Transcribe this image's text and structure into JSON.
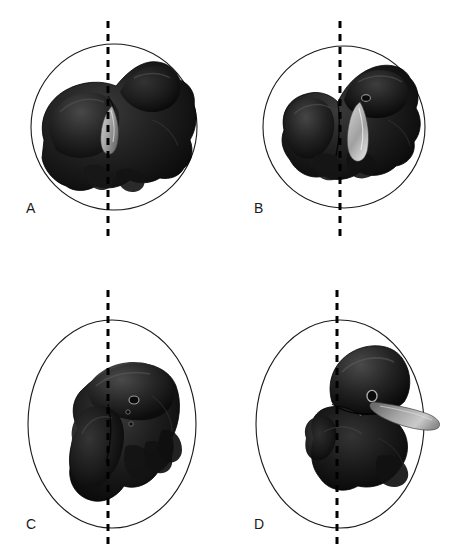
{
  "figure": {
    "background_color": "#ffffff",
    "outline_color": "#1a1a1a",
    "midline_color": "#000000",
    "specimen_dark": "#141414",
    "specimen_mid": "#2b2b2b",
    "specimen_highlight": "#555555",
    "accessory_gray": "#9a9a9a",
    "accessory_gray_light": "#cfcfcf",
    "panel_count": 4,
    "layout": "2x2 grid",
    "width": 456,
    "height": 557
  },
  "panels": [
    {
      "id": "A",
      "label": "A",
      "label_x": 26,
      "label_y": 201,
      "boundary_shape": "circle",
      "boundary_cx": 114,
      "boundary_cy": 127,
      "boundary_rx": 83,
      "boundary_ry": 83,
      "midline_x": 108,
      "midline_y1": 21,
      "midline_y2": 237,
      "specimen_name": "liver-specimen-a",
      "orientation": "transverse-superior-view",
      "accessory_structure": "gallbladder-teardrop",
      "accessory_visible": true
    },
    {
      "id": "B",
      "label": "B",
      "label_x": 254,
      "label_y": 201,
      "boundary_shape": "circle",
      "boundary_cx": 344,
      "boundary_cy": 127,
      "boundary_rx": 80,
      "boundary_ry": 83,
      "midline_x": 340,
      "midline_y1": 21,
      "midline_y2": 237,
      "specimen_name": "liver-specimen-b",
      "orientation": "transverse-view",
      "accessory_structure": "gallbladder-teardrop",
      "accessory_visible": true
    },
    {
      "id": "C",
      "label": "C",
      "label_x": 26,
      "label_y": 517,
      "boundary_shape": "ellipse",
      "boundary_cx": 112,
      "boundary_cy": 424,
      "boundary_rx": 84,
      "boundary_ry": 104,
      "midline_x": 108,
      "midline_y1": 290,
      "midline_y2": 548,
      "specimen_name": "liver-specimen-c",
      "orientation": "lateral-view",
      "accessory_structure": "none",
      "accessory_visible": false
    },
    {
      "id": "D",
      "label": "D",
      "label_x": 254,
      "label_y": 517,
      "boundary_shape": "ellipse",
      "boundary_cx": 340,
      "boundary_cy": 424,
      "boundary_rx": 84,
      "boundary_ry": 104,
      "midline_x": 337,
      "midline_y1": 290,
      "midline_y2": 548,
      "specimen_name": "liver-specimen-d",
      "orientation": "oblique-view",
      "accessory_structure": "falciform-process-gray",
      "accessory_visible": true
    }
  ]
}
